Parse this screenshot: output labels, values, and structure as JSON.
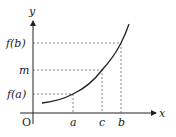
{
  "diagram": {
    "axes": {
      "x_label": "x",
      "y_label": "y",
      "origin_label": "O"
    },
    "x_ticks": [
      {
        "label": "a",
        "x": 73
      },
      {
        "label": "c",
        "x": 102
      },
      {
        "label": "b",
        "x": 121
      }
    ],
    "y_ticks": [
      {
        "label": "f(b)",
        "y": 43
      },
      {
        "label": "m",
        "y": 70
      },
      {
        "label": "f(a)",
        "y": 94
      }
    ],
    "curve": "increasing convex function f from near x=a-region to beyond b",
    "colors": {
      "ink": "#222222",
      "dash": "#555555"
    }
  }
}
